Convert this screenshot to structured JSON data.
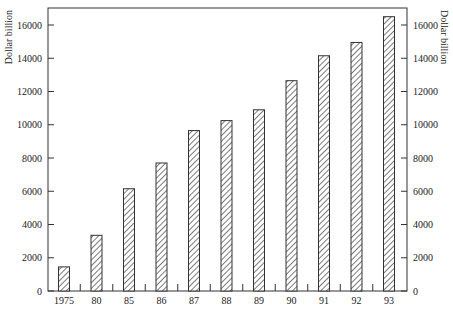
{
  "chart_data": {
    "type": "bar",
    "title": "",
    "xlabel": "",
    "ylabel": "Dollar billion",
    "ylabel_right": "Dollar billion",
    "categories": [
      "1975",
      "80",
      "85",
      "86",
      "87",
      "88",
      "89",
      "90",
      "91",
      "92",
      "93"
    ],
    "values": [
      1450,
      3350,
      6150,
      7700,
      9650,
      10250,
      10900,
      12650,
      14150,
      14950,
      16500
    ],
    "ylim": [
      0,
      16000
    ],
    "yticks": [
      0,
      2000,
      4000,
      6000,
      8000,
      10000,
      12000,
      14000,
      16000
    ],
    "grid": false,
    "legend": null,
    "bar_fill": "diagonal-hatch"
  }
}
